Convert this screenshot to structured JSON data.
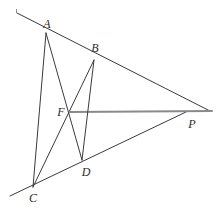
{
  "figure": {
    "width": 217,
    "height": 217,
    "background_color": "#ffffff",
    "stroke_color": "#3a3a3a",
    "accent_stroke_color": "#8a8a8a",
    "label_color": "#2b2b2b",
    "points": [
      {
        "id": "A",
        "label": "A",
        "x": 46,
        "y": 33,
        "label_x": 47,
        "label_y": 24
      },
      {
        "id": "B",
        "label": "B",
        "x": 94,
        "y": 60,
        "label_x": 95,
        "label_y": 48
      },
      {
        "id": "F",
        "label": "F",
        "x": 70,
        "y": 112,
        "label_x": 61,
        "label_y": 112
      },
      {
        "id": "P",
        "label": "P",
        "x": 186,
        "y": 112,
        "label_x": 192,
        "label_y": 124
      },
      {
        "id": "D",
        "label": "D",
        "x": 82,
        "y": 160,
        "label_x": 86,
        "label_y": 172
      },
      {
        "id": "C",
        "label": "C",
        "x": 33,
        "y": 187,
        "label_x": 33,
        "label_y": 198
      }
    ],
    "segments": [
      {
        "id": "line-ABP",
        "name": "line-a-b-p",
        "x1": 17,
        "y1": 13,
        "x2": 210,
        "y2": 111,
        "stroke": "#3a3a3a",
        "width": 1
      },
      {
        "id": "line-CDP",
        "name": "line-c-d-p",
        "x1": 10,
        "y1": 196,
        "x2": 186,
        "y2": 112,
        "stroke": "#3a3a3a",
        "width": 1
      },
      {
        "id": "line-AFD",
        "name": "cevian-a-f-d",
        "x1": 46,
        "y1": 33,
        "x2": 82,
        "y2": 160,
        "stroke": "#3a3a3a",
        "width": 1
      },
      {
        "id": "line-BFC",
        "name": "cevian-b-f-c",
        "x1": 94,
        "y1": 60,
        "x2": 33,
        "y2": 187,
        "stroke": "#3a3a3a",
        "width": 1
      },
      {
        "id": "line-FP",
        "name": "line-f-p",
        "x1": 70,
        "y1": 112,
        "x2": 212,
        "y2": 111,
        "stroke": "#8a8a8a",
        "width": 2
      },
      {
        "id": "line-AC",
        "name": "side-a-c",
        "x1": 46,
        "y1": 33,
        "x2": 33,
        "y2": 187,
        "stroke": "#3a3a3a",
        "width": 1
      },
      {
        "id": "line-BD",
        "name": "side-b-d",
        "x1": 94,
        "y1": 60,
        "x2": 82,
        "y2": 160,
        "stroke": "#3a3a3a",
        "width": 1
      }
    ],
    "marks": [
      {
        "id": "tick-top-left",
        "name": "corner-tick-mark",
        "x": 16,
        "y": 9,
        "width": 1,
        "height": 4
      }
    ]
  }
}
